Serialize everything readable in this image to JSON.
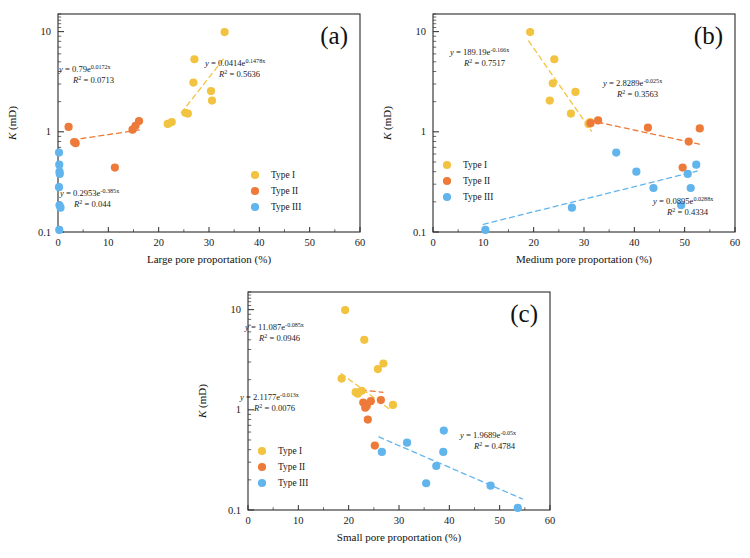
{
  "figure": {
    "colors": {
      "type1": "#f2c340",
      "type2": "#ee7a3a",
      "type3": "#62b4ec",
      "axis": "#2b2b2b"
    },
    "legend": {
      "items": [
        {
          "label": "Type I",
          "color_key": "type1"
        },
        {
          "label": "Type II",
          "color_key": "type2"
        },
        {
          "label": "Type III",
          "color_key": "type3"
        }
      ]
    },
    "y_axis": {
      "label": "K (mD)",
      "label_italic": "K",
      "label_rest": " (mD)",
      "ticks": [
        "0.1",
        "1",
        "10"
      ],
      "min": 0.1,
      "max": 15,
      "scale": "log"
    },
    "x_axis": {
      "ticks": [
        "0",
        "10",
        "20",
        "30",
        "40",
        "50",
        "60"
      ],
      "min": 0,
      "max": 60
    }
  },
  "chart_data": [
    {
      "id": "a",
      "tag": "(a)",
      "type": "scatter",
      "title": "",
      "xlabel": "Large pore proportation (%)",
      "ylabel": "K (mD)",
      "xlim": [
        0,
        60
      ],
      "ylim": [
        0.1,
        15
      ],
      "yscale": "log",
      "grid": false,
      "legend_position": "lower-right",
      "series": [
        {
          "name": "Type I",
          "color_key": "type1",
          "points": [
            [
              21.8,
              1.2
            ],
            [
              22.6,
              1.25
            ],
            [
              25.3,
              1.55
            ],
            [
              25.8,
              1.52
            ],
            [
              26.9,
              3.1
            ],
            [
              27.1,
              5.3
            ],
            [
              30.4,
              2.55
            ],
            [
              30.6,
              2.05
            ],
            [
              33.1,
              9.9
            ]
          ]
        },
        {
          "name": "Type II",
          "color_key": "type2",
          "points": [
            [
              2.1,
              1.12
            ],
            [
              3.2,
              0.79
            ],
            [
              3.5,
              0.77
            ],
            [
              11.3,
              0.44
            ],
            [
              14.8,
              1.05
            ],
            [
              15.4,
              1.15
            ],
            [
              16.1,
              1.28
            ]
          ]
        },
        {
          "name": "Type III",
          "color_key": "type3",
          "points": [
            [
              0.2,
              0.62
            ],
            [
              0.25,
              0.47
            ],
            [
              0.3,
              0.4
            ],
            [
              0.35,
              0.38
            ],
            [
              0.2,
              0.28
            ],
            [
              0.3,
              0.185
            ],
            [
              0.5,
              0.175
            ],
            [
              0.25,
              0.105
            ]
          ]
        }
      ],
      "trendlines": [
        {
          "for": "Type I",
          "color_key": "type1",
          "a": 0.0414,
          "b": 0.1478,
          "x_start": 24.5,
          "x_end": 33.0,
          "equation": {
            "lead": "y",
            "eq": " = ",
            "coef": "0.0414",
            "base": "e",
            "exp": "0.1478x",
            "r2_label": "R",
            "r2_sup": "2",
            "r2_value": " = 0.5636",
            "full": "y = 0.0414e^0.1478x",
            "r2_full": "R² = 0.5636"
          },
          "label_pos": [
            205,
            66
          ]
        },
        {
          "for": "Type II",
          "color_key": "type2",
          "a": 0.79,
          "b": 0.0172,
          "x_start": 2.8,
          "x_end": 16.6,
          "equation": {
            "lead": "y",
            "eq": " = ",
            "coef": "0.79",
            "base": "e",
            "exp": "0.0172x",
            "r2_label": "R",
            "r2_sup": "2",
            "r2_value": " = 0.0713",
            "full": "y = 0.79e^0.0172x",
            "r2_full": "R² = 0.0713"
          },
          "label_pos": [
            59,
            72
          ]
        },
        {
          "for": "Type III",
          "color_key": "type3",
          "a": 0.2953,
          "b": -0.385,
          "x_start": 0,
          "x_end": 0,
          "equation": {
            "lead": "y",
            "eq": " = ",
            "coef": "0.2953",
            "base": "e",
            "exp": "-0.385x",
            "r2_label": "R",
            "r2_sup": "2",
            "r2_value": " = 0.044",
            "full": "y = 0.2953e^-0.385x",
            "r2_full": "R² = 0.044"
          },
          "label_pos": [
            60,
            196
          ]
        }
      ]
    },
    {
      "id": "b",
      "tag": "(b)",
      "type": "scatter",
      "title": "",
      "xlabel": "Medium pore proportation (%)",
      "ylabel": "K (mD)",
      "xlim": [
        0,
        60
      ],
      "ylim": [
        0.1,
        15
      ],
      "yscale": "log",
      "grid": false,
      "legend_position": "middle-left",
      "series": [
        {
          "name": "Type I",
          "color_key": "type1",
          "points": [
            [
              19.3,
              9.9
            ],
            [
              23.2,
              2.05
            ],
            [
              23.8,
              3.05
            ],
            [
              24.1,
              5.3
            ],
            [
              27.4,
              1.52
            ],
            [
              28.3,
              2.5
            ],
            [
              30.9,
              1.2
            ],
            [
              31.2,
              1.25
            ]
          ]
        },
        {
          "name": "Type II",
          "color_key": "type2",
          "points": [
            [
              31.3,
              1.22
            ],
            [
              32.8,
              1.3
            ],
            [
              42.7,
              1.1
            ],
            [
              49.6,
              0.44
            ],
            [
              50.8,
              0.8
            ],
            [
              53.0,
              1.08
            ]
          ]
        },
        {
          "name": "Type III",
          "color_key": "type3",
          "points": [
            [
              10.4,
              0.105
            ],
            [
              27.6,
              0.175
            ],
            [
              36.4,
              0.62
            ],
            [
              40.4,
              0.4
            ],
            [
              43.8,
              0.275
            ],
            [
              49.3,
              0.185
            ],
            [
              50.6,
              0.38
            ],
            [
              51.2,
              0.275
            ],
            [
              52.3,
              0.47
            ]
          ]
        }
      ],
      "trendlines": [
        {
          "for": "Type I",
          "color_key": "type1",
          "a": 189.19,
          "b": -0.166,
          "x_start": 19.0,
          "x_end": 31.5,
          "equation": {
            "lead": "y",
            "eq": " = ",
            "coef": "189.19",
            "base": "e",
            "exp": "-0.166x",
            "r2_label": "R",
            "r2_sup": "2",
            "r2_value": " = 0.7517",
            "full": "y = 189.19e^-0.166x",
            "r2_full": "R² = 0.7517"
          },
          "label_pos": [
            75,
            55
          ]
        },
        {
          "for": "Type II",
          "color_key": "type2",
          "a": 2.8289,
          "b": -0.025,
          "x_start": 31.0,
          "x_end": 53.5,
          "equation": {
            "lead": "y",
            "eq": " = ",
            "coef": "2.8289",
            "base": "e",
            "exp": "-0.025x",
            "r2_label": "R",
            "r2_sup": "2",
            "r2_value": " = 0.3563",
            "full": "y = 2.8289e^-0.025x",
            "r2_full": "R² = 0.3563"
          },
          "label_pos": [
            228,
            86
          ]
        },
        {
          "for": "Type III",
          "color_key": "type3",
          "a": 0.0895,
          "b": 0.0288,
          "x_start": 10.0,
          "x_end": 52.5,
          "equation": {
            "lead": "y",
            "eq": " = ",
            "coef": "0.0895",
            "base": "e",
            "exp": "0.0288x",
            "r2_label": "R",
            "r2_sup": "2",
            "r2_value": " = 0.4334",
            "full": "y = 0.0895e^0.0288x",
            "r2_full": "R² = 0.4334"
          },
          "label_pos": [
            278,
            204
          ]
        }
      ]
    },
    {
      "id": "c",
      "tag": "(c)",
      "type": "scatter",
      "title": "",
      "xlabel": "Small pore proportation (%)",
      "ylabel": "K (mD)",
      "xlim": [
        0,
        60
      ],
      "ylim": [
        0.1,
        15
      ],
      "yscale": "log",
      "grid": false,
      "legend_position": "lower-left",
      "series": [
        {
          "name": "Type I",
          "color_key": "type1",
          "points": [
            [
              18.6,
              2.05
            ],
            [
              19.3,
              9.9
            ],
            [
              21.4,
              1.5
            ],
            [
              21.8,
              1.45
            ],
            [
              22.6,
              1.55
            ],
            [
              23.1,
              5.0
            ],
            [
              25.8,
              2.55
            ],
            [
              26.9,
              2.9
            ],
            [
              28.8,
              1.12
            ]
          ]
        },
        {
          "name": "Type II",
          "color_key": "type2",
          "points": [
            [
              22.9,
              1.18
            ],
            [
              23.3,
              1.05
            ],
            [
              23.6,
              1.1
            ],
            [
              24.4,
              1.22
            ],
            [
              23.8,
              0.8
            ],
            [
              26.4,
              1.25
            ],
            [
              25.2,
              0.44
            ]
          ]
        },
        {
          "name": "Type III",
          "color_key": "type3",
          "points": [
            [
              26.6,
              0.38
            ],
            [
              31.6,
              0.47
            ],
            [
              35.4,
              0.185
            ],
            [
              37.4,
              0.275
            ],
            [
              38.8,
              0.38
            ],
            [
              38.9,
              0.62
            ],
            [
              48.2,
              0.175
            ],
            [
              53.6,
              0.105
            ]
          ]
        }
      ],
      "trendlines": [
        {
          "for": "Type I",
          "color_key": "type1",
          "a": 11.087,
          "b": -0.085,
          "x_start": 18.5,
          "x_end": 28.0,
          "equation": {
            "lead": "y",
            "eq": " = ",
            "coef": "11.087",
            "base": "e",
            "exp": "-0.085x",
            "r2_label": "R",
            "r2_sup": "2",
            "r2_value": " = 0.0946",
            "full": "y = 11.087e^-0.085x",
            "r2_full": "R² = 0.0946"
          },
          "label_pos": [
            55,
            52
          ]
        },
        {
          "for": "Type II",
          "color_key": "type2",
          "a": 2.1177,
          "b": -0.013,
          "x_start": 22.5,
          "x_end": 26.8,
          "equation": {
            "lead": "y",
            "eq": " = ",
            "coef": "2.1177",
            "base": "e",
            "exp": "-0.013x",
            "r2_label": "R",
            "r2_sup": "2",
            "r2_value": " = 0.0076",
            "full": "y = 2.1177e^-0.013x",
            "r2_full": "R² = 0.0076"
          },
          "label_pos": [
            50,
            122
          ]
        },
        {
          "for": "Type III",
          "color_key": "type3",
          "a": 1.9689,
          "b": -0.05,
          "x_start": 26.0,
          "x_end": 54.5,
          "equation": {
            "lead": "y",
            "eq": " = ",
            "coef": "1.9689",
            "base": "e",
            "exp": "-0.05x",
            "r2_label": "R",
            "r2_sup": "2",
            "r2_value": " = 0.4784",
            "full": "y = 1.9689e^-0.05x",
            "r2_full": "R² = 0.4784"
          },
          "label_pos": [
            270,
            160
          ]
        }
      ]
    }
  ]
}
